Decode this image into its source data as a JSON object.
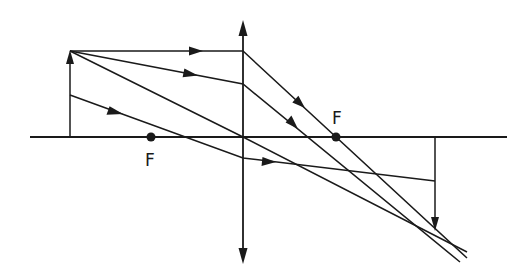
{
  "diagram": {
    "type": "converging-lens-ray-diagram",
    "ink_color": "#1a1a1a",
    "background": "#ffffff",
    "elements": {
      "optical_axis": "principal axis",
      "lens": "convex lens (double-headed arrow)",
      "object": "upright object arrow",
      "image": "inverted real image arrow",
      "focal_points": [
        {
          "id": "F-left",
          "label": "F"
        },
        {
          "id": "F-right",
          "label": "F"
        }
      ],
      "rays": [
        {
          "id": "ray-parallel",
          "description": "parallel to axis, refracts through right focal point"
        },
        {
          "id": "ray-oblique",
          "description": "oblique ray from object tip, refracts toward image point"
        },
        {
          "id": "ray-center",
          "description": "passes undeviated through lens centre"
        },
        {
          "id": "ray-lower",
          "description": "ray from lower object point, refracts toward image"
        }
      ]
    }
  }
}
